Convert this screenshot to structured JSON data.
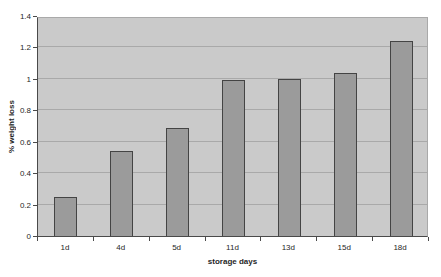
{
  "chart_data": {
    "type": "bar",
    "title": "",
    "categories": [
      "1d",
      "4d",
      "5d",
      "11d",
      "13d",
      "15d",
      "18d"
    ],
    "values": [
      0.25,
      0.54,
      0.69,
      0.99,
      1.0,
      1.04,
      1.24
    ],
    "series": [
      {
        "name": "% weight loss",
        "values": [
          0.25,
          0.54,
          0.69,
          0.99,
          1.0,
          1.04,
          1.24
        ]
      }
    ],
    "xlabel": "storage days",
    "ylabel": "% weight loss",
    "ylim": [
      0,
      1.4
    ],
    "ytick_step": 0.2,
    "ytick_labels": [
      "0",
      "0.2",
      "0.4",
      "0.6",
      "0.8",
      "1",
      "1.2",
      "1.4"
    ],
    "grid": true,
    "legend": "none",
    "colors": {
      "figure_background": "#ffffff",
      "plot_background": "#cacaca",
      "gridline": "#a9a9a9",
      "bar_fill": "#9b9b9b",
      "bar_border": "#444444",
      "axis_line": "#4a4a4a",
      "text": "#1f1f1f"
    }
  }
}
